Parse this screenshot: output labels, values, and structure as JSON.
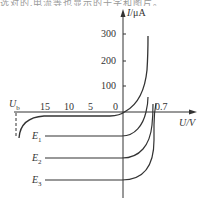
{
  "top_strip_text": "选对的,电流等也显示的十字和图片。",
  "diagram": {
    "y_axis": {
      "label_var": "I",
      "label_unit": "/μA",
      "ticks": [
        "300",
        "200",
        "100"
      ]
    },
    "x_axis": {
      "label": "U/V",
      "ticks_left": [
        "15",
        "10",
        "5",
        "0"
      ],
      "tick_right": "0.7",
      "breakdown_label_var": "U",
      "breakdown_label_sub": "b"
    },
    "curves": [
      {
        "name": "E1",
        "var": "E",
        "sub": "1"
      },
      {
        "name": "E2",
        "var": "E",
        "sub": "2"
      },
      {
        "name": "E3",
        "var": "E",
        "sub": "3"
      }
    ],
    "colors": {
      "line": "#333333",
      "text": "#333333"
    }
  }
}
